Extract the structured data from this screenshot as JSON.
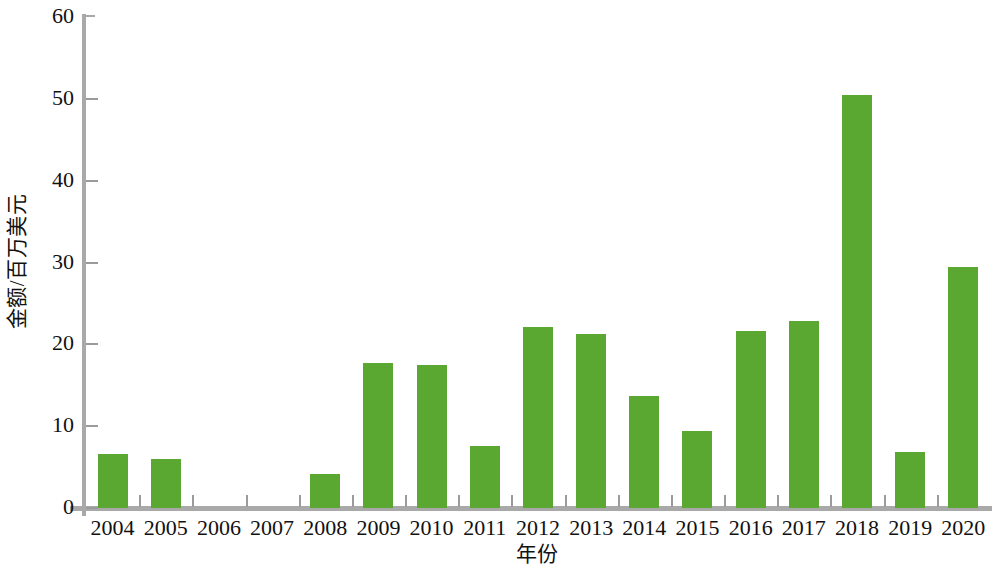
{
  "chart_data": {
    "type": "bar",
    "title": "",
    "subtitle": "",
    "xlabel": "年份",
    "ylabel": "金额/百万美元",
    "categories": [
      "2004",
      "2005",
      "2006",
      "2007",
      "2008",
      "2009",
      "2010",
      "2011",
      "2012",
      "2013",
      "2014",
      "2015",
      "2016",
      "2017",
      "2018",
      "2019",
      "2020"
    ],
    "values": [
      6.6,
      6.0,
      0,
      0,
      4.2,
      17.7,
      17.5,
      7.6,
      22.1,
      21.3,
      13.7,
      9.4,
      21.6,
      22.8,
      50.5,
      6.8,
      29.4
    ],
    "series": [
      {
        "name": "金额",
        "values": [
          6.6,
          6.0,
          0,
          0,
          4.2,
          17.7,
          17.5,
          7.6,
          22.1,
          21.3,
          13.7,
          9.4,
          21.6,
          22.8,
          50.5,
          6.8,
          29.4
        ]
      }
    ],
    "ylim": [
      0,
      60
    ],
    "ytick_values": [
      0,
      10,
      20,
      30,
      40,
      50,
      60
    ],
    "ytick_labels": [
      "0",
      "10",
      "20",
      "30",
      "40",
      "50",
      "60"
    ],
    "grid": false,
    "legend": false,
    "legend_position": "none",
    "bar_color": "#5aa832",
    "axis_color": "#a9a9a9",
    "text_color": "#111111",
    "background_color": "#ffffff"
  }
}
